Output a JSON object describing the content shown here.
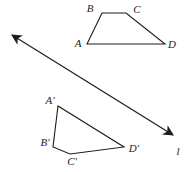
{
  "figure": {
    "width": 184,
    "height": 172,
    "background": "#ffffff",
    "stroke_color": "#1c1c1c",
    "line": {
      "name": "reflection-line",
      "x1": 12,
      "y1": 35,
      "x2": 173,
      "y2": 135,
      "arrow_start": true,
      "arrow_end": true,
      "label": {
        "text": "l",
        "x": 178,
        "y": 155
      }
    },
    "shapes": [
      {
        "name": "trapezoid-abcd",
        "points": [
          [
            87,
            44
          ],
          [
            102,
            13
          ],
          [
            126,
            13
          ],
          [
            165,
            44
          ]
        ],
        "labels": [
          {
            "text": "A",
            "x": 78,
            "y": 47
          },
          {
            "text": "B",
            "x": 90,
            "y": 12
          },
          {
            "text": "C",
            "x": 137,
            "y": 13
          },
          {
            "text": "D",
            "x": 172,
            "y": 48
          }
        ]
      },
      {
        "name": "trapezoid-a-prime-b-prime-c-prime-d-prime",
        "points": [
          [
            58,
            106
          ],
          [
            53,
            147
          ],
          [
            70,
            154
          ],
          [
            124,
            147
          ]
        ],
        "labels": [
          {
            "text": "A′",
            "x": 50,
            "y": 104
          },
          {
            "text": "B′",
            "x": 45,
            "y": 146
          },
          {
            "text": "C′",
            "x": 72,
            "y": 165
          },
          {
            "text": "D′",
            "x": 134,
            "y": 152
          }
        ]
      }
    ]
  }
}
